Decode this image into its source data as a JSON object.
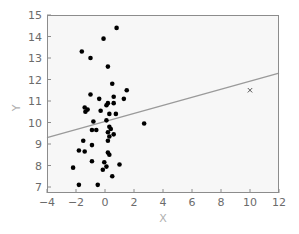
{
  "chart_data": {
    "type": "scatter",
    "title": "",
    "xlabel": "X",
    "ylabel": "Y",
    "xlim": [
      -4,
      12
    ],
    "ylim": [
      6.7,
      15
    ],
    "xticks": [
      -4,
      -2,
      0,
      2,
      4,
      6,
      8,
      10,
      12
    ],
    "yticks": [
      7,
      8,
      9,
      10,
      11,
      12,
      13,
      14,
      15
    ],
    "grid": false,
    "legend": null,
    "series": [
      {
        "name": "data points",
        "marker": "circle",
        "color": "#000000",
        "points": [
          [
            0.8,
            14.4
          ],
          [
            -0.1,
            13.9
          ],
          [
            -1.6,
            13.3
          ],
          [
            -1.0,
            13.0
          ],
          [
            0.2,
            12.6
          ],
          [
            0.5,
            11.8
          ],
          [
            1.5,
            11.5
          ],
          [
            -1.0,
            11.3
          ],
          [
            0.6,
            11.2
          ],
          [
            1.3,
            11.1
          ],
          [
            -0.4,
            11.1
          ],
          [
            0.2,
            10.9
          ],
          [
            0.6,
            10.9
          ],
          [
            0.1,
            10.8
          ],
          [
            -1.4,
            10.7
          ],
          [
            -1.2,
            10.6
          ],
          [
            -0.3,
            10.55
          ],
          [
            -1.35,
            10.5
          ],
          [
            0.3,
            10.4
          ],
          [
            0.75,
            10.4
          ],
          [
            -0.8,
            10.05
          ],
          [
            0.1,
            10.1
          ],
          [
            2.7,
            9.95
          ],
          [
            0.3,
            9.8
          ],
          [
            0.4,
            9.7
          ],
          [
            -0.9,
            9.65
          ],
          [
            -0.6,
            9.65
          ],
          [
            0.2,
            9.55
          ],
          [
            0.6,
            9.45
          ],
          [
            0.3,
            9.35
          ],
          [
            0.2,
            9.15
          ],
          [
            -1.5,
            9.15
          ],
          [
            -0.9,
            8.95
          ],
          [
            -1.8,
            8.7
          ],
          [
            -1.4,
            8.65
          ],
          [
            0.2,
            8.6
          ],
          [
            0.3,
            8.5
          ],
          [
            -0.9,
            8.2
          ],
          [
            -0.05,
            8.15
          ],
          [
            1.0,
            8.05
          ],
          [
            0.1,
            7.95
          ],
          [
            -2.2,
            7.9
          ],
          [
            -0.15,
            7.8
          ],
          [
            0.5,
            7.5
          ],
          [
            -1.8,
            7.1
          ],
          [
            -0.5,
            7.1
          ]
        ]
      },
      {
        "name": "outlier",
        "marker": "x",
        "color": "#555555",
        "points": [
          [
            10.0,
            11.5
          ]
        ]
      }
    ],
    "lines": [
      {
        "name": "fit line",
        "color": "#9a9a9a",
        "x": [
          -4,
          12
        ],
        "y": [
          9.3,
          12.3
        ]
      }
    ]
  },
  "colors": {
    "plot_background": "#f7f7f7",
    "frame": "#8c8c8c",
    "points": "#000000",
    "line": "#9a9a9a",
    "tick_label": "#6b6b6b",
    "axis_title": "#b0b0b0"
  }
}
